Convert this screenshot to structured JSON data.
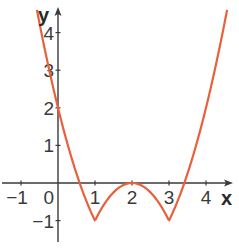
{
  "chart_data": {
    "type": "line",
    "title": "",
    "xlabel": "x",
    "ylabel": "y",
    "xlim": [
      -1.3,
      4.6
    ],
    "ylim": [
      -1.6,
      4.7
    ],
    "grid": false,
    "x_ticks": [
      -1,
      0,
      1,
      2,
      3,
      4
    ],
    "y_ticks": [
      -1,
      1,
      2,
      3,
      4
    ],
    "x_tick_labels": [
      "−1",
      "0",
      "1",
      "2",
      "3",
      "4"
    ],
    "y_tick_labels": [
      "−1",
      "1",
      "2",
      "3",
      "4"
    ],
    "series": [
      {
        "name": "f(x)",
        "color": "#e8603c",
        "x": [
          -0.57,
          -0.5,
          -0.25,
          0,
          0.25,
          0.5,
          0.57,
          0.75,
          1,
          1.25,
          1.5,
          1.75,
          2,
          2.25,
          2.5,
          2.75,
          3,
          3.25,
          3.43,
          3.5,
          3.75,
          4,
          4.25,
          4.57
        ],
        "values": [
          4.6,
          4.25,
          3.06,
          2,
          1.06,
          0.25,
          0.04,
          -0.44,
          -1,
          -0.56,
          -0.25,
          -0.06,
          0,
          -0.06,
          -0.25,
          -0.56,
          -1,
          -0.44,
          0.04,
          0.25,
          1.06,
          2,
          3.06,
          4.6
        ]
      }
    ],
    "key_points": [
      {
        "x": 0,
        "y": 2
      },
      {
        "x": 1,
        "y": -1
      },
      {
        "x": 2,
        "y": 0
      },
      {
        "x": 3,
        "y": -1
      }
    ]
  },
  "colors": {
    "curve": "#e8603c",
    "axis": "#3a3a3a",
    "text": "#3a3a3a"
  }
}
